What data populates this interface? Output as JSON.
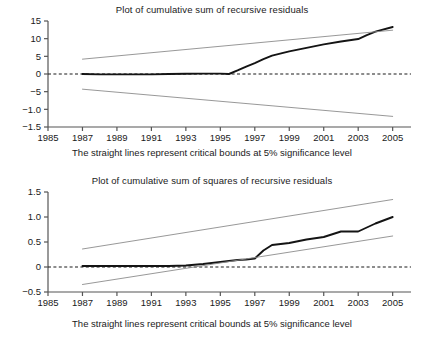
{
  "figure": {
    "caption_shared": "The straight lines represent critical bounds at 5% significance level"
  },
  "chart_data": [
    {
      "id": "cusum",
      "type": "line",
      "title": "Plot of cumulative sum of recursive residuals",
      "xlabel": "",
      "ylabel": "",
      "caption": "The straight lines represent critical bounds at 5% significance level",
      "xlim": [
        1985,
        2005.6
      ],
      "ylim": [
        -1.5,
        15
      ],
      "grid": false,
      "legend": "none",
      "xticks": [
        1985,
        1987,
        1989,
        1991,
        1993,
        1995,
        1997,
        1999,
        2001,
        2003,
        2005
      ],
      "xticklabels": [
        "1985",
        "1987",
        "1989",
        "1991",
        "1993",
        "1995",
        "1997",
        "1999",
        "2001",
        "2003",
        "2005"
      ],
      "yticks": [
        15,
        10,
        5,
        0,
        -5,
        -1.0,
        -1.5
      ],
      "yticklabels": [
        "15",
        "10",
        "5",
        "0",
        "-5",
        "-1.0",
        "-1.5"
      ],
      "zero_line": 0,
      "colors": {
        "data_line": "#141414",
        "bound_line": "#8c8c8c",
        "zero_line": "#1a1a1a",
        "axis": "#555555"
      },
      "series": [
        {
          "name": "CUSUM",
          "style": "solid-thick",
          "color": "#141414",
          "x": [
            1987,
            1988,
            1989,
            1990,
            1991,
            1992,
            1993,
            1994,
            1995,
            1995.5,
            1996,
            1996.5,
            1997,
            1997.5,
            1998,
            1999,
            2000,
            2001,
            2002,
            2003,
            2003.5,
            2004,
            2005
          ],
          "y": [
            0.0,
            -0.1,
            -0.1,
            -0.1,
            -0.1,
            0.0,
            0.05,
            0.1,
            0.1,
            0.0,
            1.0,
            2.1,
            3.1,
            4.2,
            5.2,
            6.4,
            7.4,
            8.4,
            9.2,
            9.9,
            11.0,
            12.0,
            13.3
          ]
        },
        {
          "name": "Upper 5% critical bound",
          "style": "solid-thin",
          "color": "#8c8c8c",
          "x": [
            1987,
            2005
          ],
          "y": [
            4.2,
            12.4
          ]
        },
        {
          "name": "Lower 5% critical bound",
          "style": "solid-thin",
          "color": "#8c8c8c",
          "x": [
            1987,
            2005
          ],
          "y": [
            -4.3,
            -12.0
          ]
        }
      ]
    },
    {
      "id": "cusumsq",
      "type": "line",
      "title": "Plot of cumulative sum of squares of recursive residuals",
      "xlabel": "",
      "ylabel": "",
      "caption": "The straight lines represent critical bounds at 5% significance level",
      "xlim": [
        1985,
        2005.6
      ],
      "ylim": [
        -0.5,
        1.5
      ],
      "grid": false,
      "legend": "none",
      "xticks": [
        1985,
        1987,
        1989,
        1991,
        1993,
        1995,
        1997,
        1999,
        2001,
        2003,
        2005
      ],
      "xticklabels": [
        "1985",
        "1987",
        "1989",
        "1991",
        "1993",
        "1995",
        "1997",
        "1999",
        "2001",
        "2003",
        "2005"
      ],
      "yticks": [
        1.5,
        1.0,
        0.5,
        0,
        -0.5
      ],
      "yticklabels": [
        "1.5",
        "1.0",
        "0.5",
        "0",
        "-0.5"
      ],
      "zero_line": 0,
      "colors": {
        "data_line": "#141414",
        "bound_line": "#8c8c8c",
        "zero_line": "#1a1a1a",
        "axis": "#555555"
      },
      "series": [
        {
          "name": "CUSUM of squares",
          "style": "solid-thick",
          "color": "#141414",
          "x": [
            1987,
            1988,
            1989,
            1990,
            1991,
            1992,
            1993,
            1994,
            1995,
            1996,
            1996.5,
            1997,
            1997.5,
            1998,
            1999,
            2000,
            2001,
            2002,
            2002.5,
            2003,
            2004,
            2005
          ],
          "y": [
            0.02,
            0.02,
            0.02,
            0.02,
            0.02,
            0.02,
            0.03,
            0.06,
            0.1,
            0.14,
            0.15,
            0.17,
            0.33,
            0.44,
            0.48,
            0.55,
            0.6,
            0.71,
            0.71,
            0.71,
            0.87,
            1.0
          ]
        },
        {
          "name": "Upper 5% critical bound",
          "style": "solid-thin",
          "color": "#8c8c8c",
          "x": [
            1987,
            2005
          ],
          "y": [
            0.36,
            1.35
          ]
        },
        {
          "name": "Lower 5% critical bound",
          "style": "solid-thin",
          "color": "#8c8c8c",
          "x": [
            1987,
            2005
          ],
          "y": [
            -0.35,
            0.62
          ]
        }
      ]
    }
  ]
}
